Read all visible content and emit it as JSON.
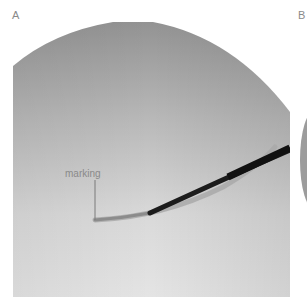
{
  "panels": [
    {
      "id": "A",
      "label": "A"
    },
    {
      "id": "B",
      "label": "B"
    }
  ],
  "figure_a": {
    "annotation": "marking",
    "colors": {
      "background": "#ffffff",
      "field_top": "#9a9a9a",
      "field_bottom": "#e2e2e2",
      "instrument": "#1c1c1c",
      "shadow": "#a8a8a8",
      "label": "#8a8a8a"
    }
  }
}
